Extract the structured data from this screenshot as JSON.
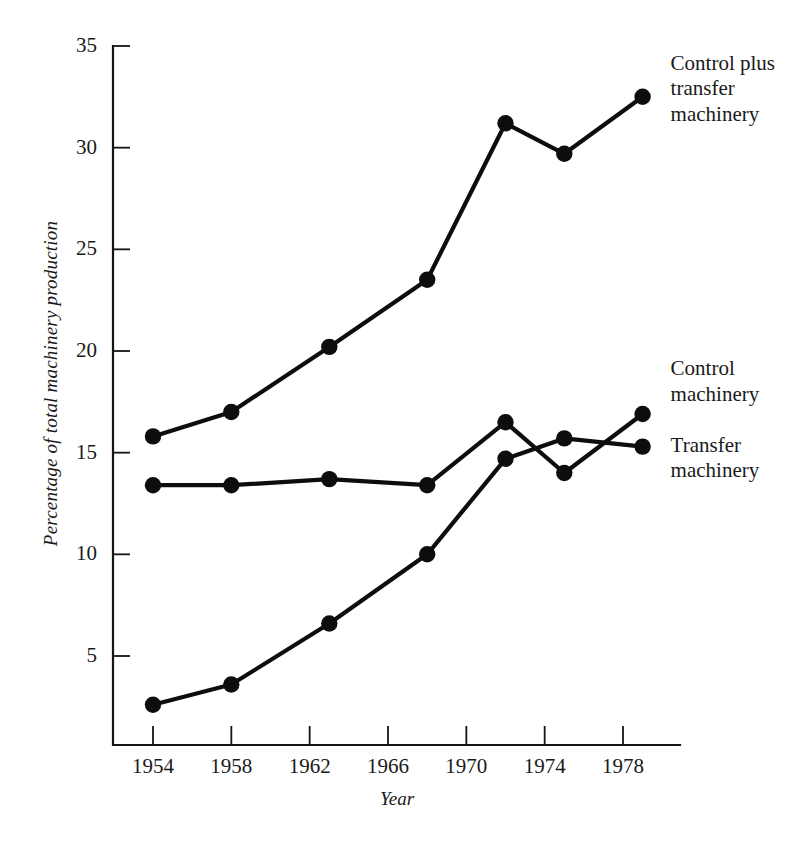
{
  "chart_data": {
    "type": "line",
    "title": "",
    "subtitle": "",
    "xlabel": "Year",
    "ylabel": "Percentage of total machinery production",
    "xlim": [
      1953,
      1980
    ],
    "ylim": [
      0,
      35
    ],
    "xticks": [
      1954,
      1958,
      1962,
      1966,
      1970,
      1974,
      1978
    ],
    "xtick_labels": [
      "1954",
      "1958",
      "1962",
      "1966",
      "1970",
      "1974",
      "1978"
    ],
    "yticks": [
      5,
      10,
      15,
      20,
      25,
      30,
      35
    ],
    "ytick_labels": [
      "5",
      "10",
      "15",
      "20",
      "25",
      "30",
      "35"
    ],
    "grid": false,
    "legend_position": "inline-right-annotations",
    "marker": "filled-circle",
    "series": [
      {
        "name": "Control plus transfer machinery",
        "label_lines": "Control plus\ntransfer\nmachinery",
        "color": "#0d0d0d",
        "x": [
          1954,
          1958,
          1963,
          1968,
          1972,
          1975,
          1979
        ],
        "values": [
          15.8,
          17.0,
          20.2,
          23.5,
          31.2,
          29.7,
          32.5
        ]
      },
      {
        "name": "Control machinery",
        "label_lines": "Control\nmachinery",
        "color": "#0d0d0d",
        "x": [
          1954,
          1958,
          1963,
          1968,
          1972,
          1975,
          1979
        ],
        "values": [
          13.4,
          13.4,
          13.7,
          13.4,
          16.5,
          14.0,
          16.9
        ]
      },
      {
        "name": "Transfer machinery",
        "label_lines": "Transfer\nmachinery",
        "color": "#0d0d0d",
        "x": [
          1954,
          1958,
          1963,
          1968,
          1972,
          1975,
          1979
        ],
        "values": [
          2.6,
          3.6,
          6.6,
          10.0,
          14.7,
          15.7,
          15.3
        ]
      }
    ],
    "annotations": [
      {
        "text": "Control plus\ntransfer\nmachinery",
        "target_series": "Control plus transfer machinery"
      },
      {
        "text": "Control\nmachinery",
        "target_series": "Control machinery"
      },
      {
        "text": "Transfer\nmachinery",
        "target_series": "Transfer machinery"
      }
    ]
  }
}
